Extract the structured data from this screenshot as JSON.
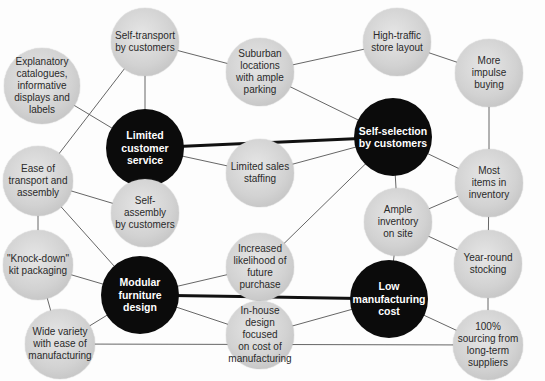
{
  "diagram": {
    "type": "activity-system-map",
    "colors": {
      "core_node": "#0b0b0b",
      "support_node": "#d2d2d2",
      "edge": "#555555",
      "strong_edge": "#111111"
    },
    "nodes": [
      {
        "id": "explanatory",
        "label": "Explanatory\ncatalogues,\ninformative\ndisplays and\nlabels",
        "kind": "support",
        "cx": 42,
        "cy": 86,
        "r": 38
      },
      {
        "id": "self_transport",
        "label": "Self-transport\nby customers",
        "kind": "support",
        "cx": 145,
        "cy": 42,
        "r": 34
      },
      {
        "id": "limited_service",
        "label": "Limited\ncustomer\nservice",
        "kind": "core",
        "cx": 145,
        "cy": 148,
        "r": 39
      },
      {
        "id": "suburban",
        "label": "Suburban\nlocations\nwith ample\nparking",
        "kind": "support",
        "cx": 260,
        "cy": 72,
        "r": 34
      },
      {
        "id": "sales_staffing",
        "label": "Limited sales\nstaffing",
        "kind": "support",
        "cx": 260,
        "cy": 173,
        "r": 34
      },
      {
        "id": "high_traffic",
        "label": "High-traffic\nstore layout",
        "kind": "support",
        "cx": 397,
        "cy": 42,
        "r": 34
      },
      {
        "id": "self_selection",
        "label": "Self-selection\nby customers",
        "kind": "core",
        "cx": 393,
        "cy": 137,
        "r": 39
      },
      {
        "id": "impulse",
        "label": "More\nimpulse\nbuying",
        "kind": "support",
        "cx": 489,
        "cy": 73,
        "r": 34
      },
      {
        "id": "ample_inventory",
        "label": "Ample\ninventory\non site",
        "kind": "support",
        "cx": 398,
        "cy": 222,
        "r": 34
      },
      {
        "id": "most_items",
        "label": "Most\nitems in\ninventory",
        "kind": "support",
        "cx": 489,
        "cy": 183,
        "r": 34
      },
      {
        "id": "ease_transport",
        "label": "Ease of\ntransport and\nassembly",
        "kind": "support",
        "cx": 38,
        "cy": 181,
        "r": 35
      },
      {
        "id": "self_assembly",
        "label": "Self-assembly\nby customers",
        "kind": "support",
        "cx": 145,
        "cy": 213,
        "r": 34
      },
      {
        "id": "knock_down",
        "label": "\"Knock-down\"\nkit packaging",
        "kind": "support",
        "cx": 38,
        "cy": 265,
        "r": 35
      },
      {
        "id": "modular",
        "label": "Modular\nfurniture\ndesign",
        "kind": "core",
        "cx": 140,
        "cy": 295,
        "r": 39
      },
      {
        "id": "future_purchase",
        "label": "Increased\nlikelihood of\nfuture\npurchase",
        "kind": "support",
        "cx": 260,
        "cy": 267,
        "r": 34
      },
      {
        "id": "in_house",
        "label": "In-house\ndesign focused\non cost of\nmanufacturing",
        "kind": "support",
        "cx": 260,
        "cy": 335,
        "r": 34
      },
      {
        "id": "low_cost",
        "label": "Low\nmanufacturing\ncost",
        "kind": "core",
        "cx": 389,
        "cy": 299,
        "r": 39
      },
      {
        "id": "year_round",
        "label": "Year-round\nstocking",
        "kind": "support",
        "cx": 488,
        "cy": 264,
        "r": 34
      },
      {
        "id": "sourcing",
        "label": "100%\nsourcing from\nlong-term\nsuppliers",
        "kind": "support",
        "cx": 488,
        "cy": 345,
        "r": 35
      },
      {
        "id": "wide_variety",
        "label": "Wide variety\nwith ease of\nmanufacturing",
        "kind": "support",
        "cx": 60,
        "cy": 344,
        "r": 35
      }
    ],
    "edges": [
      {
        "from": "limited_service",
        "to": "self_selection",
        "strong": true
      },
      {
        "from": "modular",
        "to": "low_cost",
        "strong": true
      },
      {
        "from": "explanatory",
        "to": "limited_service"
      },
      {
        "from": "self_transport",
        "to": "limited_service"
      },
      {
        "from": "self_transport",
        "to": "suburban"
      },
      {
        "from": "self_transport",
        "to": "ease_transport"
      },
      {
        "from": "limited_service",
        "to": "sales_staffing"
      },
      {
        "from": "limited_service",
        "to": "self_assembly"
      },
      {
        "from": "suburban",
        "to": "high_traffic"
      },
      {
        "from": "suburban",
        "to": "self_selection"
      },
      {
        "from": "high_traffic",
        "to": "impulse"
      },
      {
        "from": "sales_staffing",
        "to": "self_selection"
      },
      {
        "from": "self_selection",
        "to": "future_purchase"
      },
      {
        "from": "self_selection",
        "to": "ample_inventory"
      },
      {
        "from": "self_selection",
        "to": "most_items"
      },
      {
        "from": "impulse",
        "to": "most_items"
      },
      {
        "from": "ample_inventory",
        "to": "most_items"
      },
      {
        "from": "ample_inventory",
        "to": "year_round"
      },
      {
        "from": "ample_inventory",
        "to": "low_cost"
      },
      {
        "from": "most_items",
        "to": "year_round"
      },
      {
        "from": "year_round",
        "to": "sourcing"
      },
      {
        "from": "low_cost",
        "to": "sourcing"
      },
      {
        "from": "ease_transport",
        "to": "self_assembly"
      },
      {
        "from": "ease_transport",
        "to": "knock_down"
      },
      {
        "from": "ease_transport",
        "to": "modular"
      },
      {
        "from": "knock_down",
        "to": "modular"
      },
      {
        "from": "knock_down",
        "to": "wide_variety"
      },
      {
        "from": "modular",
        "to": "future_purchase"
      },
      {
        "from": "modular",
        "to": "in_house"
      },
      {
        "from": "modular",
        "to": "wide_variety"
      },
      {
        "from": "in_house",
        "to": "low_cost"
      },
      {
        "from": "wide_variety",
        "to": "sourcing"
      }
    ]
  }
}
